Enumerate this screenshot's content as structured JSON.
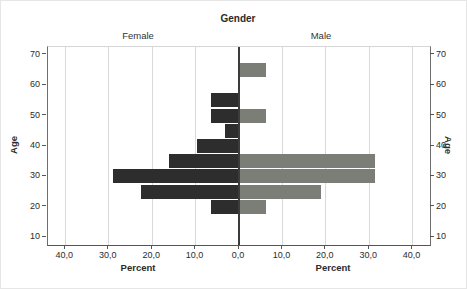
{
  "title": "Gender",
  "chart_data": {
    "type": "bar",
    "subtype": "population-pyramid",
    "title": "Gender",
    "xlabel": "Percent",
    "ylabel": "Age",
    "bin_width_years": 5,
    "age_axis_range": [
      7.5,
      72.5
    ],
    "pct_axis_max": 44,
    "age_ticks": [
      10,
      20,
      30,
      40,
      50,
      60,
      70
    ],
    "pct_ticks": [
      {
        "label": "40,0",
        "value": -40
      },
      {
        "label": "30,0",
        "value": -30
      },
      {
        "label": "20,0",
        "value": -20
      },
      {
        "label": "10,0",
        "value": -10
      },
      {
        "label": "0,0",
        "value": 0
      },
      {
        "label": "10,0",
        "value": 10
      },
      {
        "label": "20,0",
        "value": 20
      },
      {
        "label": "30,0",
        "value": 30
      },
      {
        "label": "40,0",
        "value": 40
      }
    ],
    "grid": true,
    "legend_position": "none",
    "series": [
      {
        "name": "Female",
        "side": "left",
        "color": "#2e2d2d",
        "bins": [
          {
            "age_center": 55,
            "pct": 6.5
          },
          {
            "age_center": 50,
            "pct": 6.5
          },
          {
            "age_center": 45,
            "pct": 3.2
          },
          {
            "age_center": 40,
            "pct": 9.7
          },
          {
            "age_center": 35,
            "pct": 16.1
          },
          {
            "age_center": 30,
            "pct": 29.0
          },
          {
            "age_center": 25,
            "pct": 22.6
          },
          {
            "age_center": 20,
            "pct": 6.5
          }
        ]
      },
      {
        "name": "Male",
        "side": "right",
        "color": "#7b7e76",
        "bins": [
          {
            "age_center": 65,
            "pct": 6.3
          },
          {
            "age_center": 50,
            "pct": 6.3
          },
          {
            "age_center": 35,
            "pct": 31.3
          },
          {
            "age_center": 30,
            "pct": 31.3
          },
          {
            "age_center": 25,
            "pct": 18.8
          },
          {
            "age_center": 20,
            "pct": 6.3
          }
        ]
      }
    ],
    "colors": {
      "gridline": "#d9d9d9",
      "center_line": "#3c3c3c",
      "axis_frame": "#6e6e6e",
      "text": "#2b2b2b"
    }
  }
}
